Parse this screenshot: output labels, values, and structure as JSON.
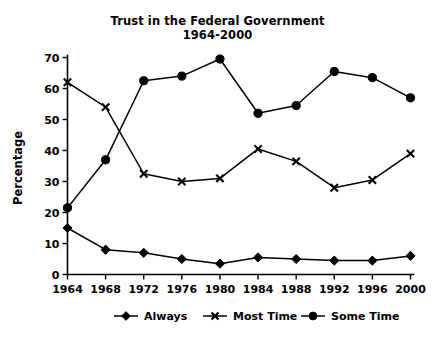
{
  "chart_data": {
    "type": "line",
    "title": "Trust in the Federal Government",
    "subtitle": "1964-2000",
    "xlabel": "",
    "ylabel": "Percentage",
    "x": [
      1964,
      1968,
      1972,
      1976,
      1980,
      1984,
      1988,
      1992,
      1996,
      2000
    ],
    "categories": [
      "1964",
      "1968",
      "1972",
      "1976",
      "1980",
      "1984",
      "1988",
      "1992",
      "1996",
      "2000"
    ],
    "xlim": [
      1964,
      2000
    ],
    "ylim": [
      0,
      70
    ],
    "yticks": [
      0,
      10,
      20,
      30,
      40,
      50,
      60,
      70
    ],
    "ytick_labels": [
      "0",
      "10",
      "20",
      "30",
      "40",
      "50",
      "60",
      "70"
    ],
    "grid": false,
    "legend_position": "bottom",
    "series": [
      {
        "name": "Always",
        "marker": "diamond",
        "color": "#000000",
        "values": [
          15,
          8,
          7,
          5,
          3.5,
          5.5,
          5,
          4.5,
          4.5,
          6
        ]
      },
      {
        "name": "Most Time",
        "marker": "x",
        "color": "#000000",
        "values": [
          62,
          54,
          32.5,
          30,
          31,
          40.5,
          36.5,
          28,
          30.5,
          39
        ]
      },
      {
        "name": "Some Time",
        "marker": "circle",
        "color": "#000000",
        "values": [
          21.5,
          37,
          62.5,
          64,
          69.5,
          52,
          54.5,
          65.5,
          63.5,
          57
        ]
      }
    ]
  },
  "legend": {
    "items": [
      {
        "label": "Always",
        "marker": "diamond"
      },
      {
        "label": "Most Time",
        "marker": "x"
      },
      {
        "label": "Some Time",
        "marker": "circle"
      }
    ]
  }
}
